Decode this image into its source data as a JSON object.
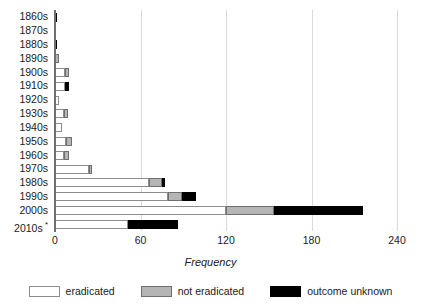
{
  "chart_data": {
    "type": "bar",
    "orientation": "horizontal",
    "stacked": true,
    "title": "",
    "xlabel": "Frequency",
    "ylabel": "",
    "xlim": [
      0,
      240
    ],
    "xticks": [
      0,
      60,
      120,
      180,
      240
    ],
    "xtick_labels": [
      "0",
      "60",
      "120",
      "180",
      "240"
    ],
    "grid": "vertical",
    "legend_position": "bottom",
    "categories": [
      "1860s",
      "1870s",
      "1880s",
      "1890s",
      "1900s",
      "1910s",
      "1920s",
      "1930s",
      "1940s",
      "1950s",
      "1960s",
      "1970s",
      "1980s",
      "1990s",
      "2000s",
      "2010s"
    ],
    "category_notes": {
      "2010s": "*"
    },
    "series": [
      {
        "name": "eradicated",
        "color": "#ffffff",
        "values": [
          0,
          0,
          0,
          0,
          7,
          7,
          3,
          6,
          5,
          8,
          6,
          24,
          66,
          79,
          120,
          51
        ]
      },
      {
        "name": "not eradicated",
        "color": "#b5b5b5",
        "values": [
          0,
          0,
          0,
          3,
          3,
          0,
          0,
          3,
          0,
          4,
          4,
          2,
          9,
          10,
          34,
          0
        ]
      },
      {
        "name": "outcome unknown",
        "color": "#000000",
        "values": [
          1,
          0,
          1,
          0,
          0,
          3,
          0,
          0,
          0,
          0,
          0,
          0,
          2,
          10,
          62,
          35
        ]
      }
    ],
    "totals": [
      1,
      0,
      1,
      3,
      10,
      10,
      3,
      9,
      5,
      12,
      10,
      26,
      77,
      99,
      216,
      86
    ]
  },
  "legend": {
    "items": [
      {
        "label": "eradicated",
        "swatch": "white-outlined-swatch"
      },
      {
        "label": "not eradicated",
        "swatch": "gray-swatch"
      },
      {
        "label": "outcome unknown",
        "swatch": "black-swatch"
      }
    ]
  },
  "colors": {
    "eradicated": "#ffffff",
    "eradicated_border": "#8c8c8c",
    "not_eradicated": "#b5b5b5",
    "not_eradicated_border": "#6f6f6f",
    "outcome_unknown": "#000000",
    "gridline": "#d9d9d9",
    "axis": "#6e6e6e",
    "text": "#1a1a1a",
    "background": "#ffffff"
  }
}
